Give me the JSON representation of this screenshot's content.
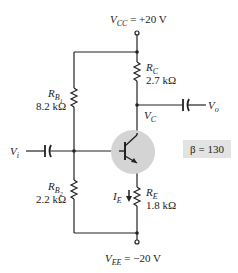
{
  "supply": {
    "vcc_label": "V",
    "vcc_sub": "CC",
    "vcc_value": " = +20 V",
    "vee_label": "V",
    "vee_sub": "EE",
    "vee_value": " = −20 V"
  },
  "resistors": {
    "rb1": {
      "name": "R",
      "sub": "B",
      "subsub": "1",
      "value": "8.2 kΩ"
    },
    "rb2": {
      "name": "R",
      "sub": "B",
      "subsub": "2",
      "value": "2.2 kΩ"
    },
    "rc": {
      "name": "R",
      "sub": "C",
      "value": "2.7 kΩ"
    },
    "re": {
      "name": "R",
      "sub": "E",
      "value": "1.8 kΩ"
    }
  },
  "nodes": {
    "vc": "V",
    "vc_sub": "C",
    "vi": "V",
    "vi_sub": "i",
    "vo": "V",
    "vo_sub": "o",
    "ie": "I",
    "ie_sub": "E"
  },
  "beta": {
    "label": "β = 130"
  }
}
